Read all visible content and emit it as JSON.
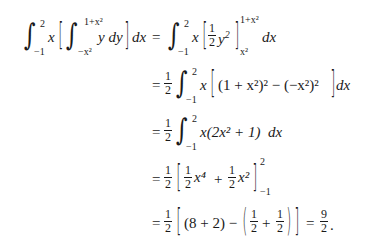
{
  "document": {
    "type": "math-derivation",
    "lines": [
      {
        "lhs": "∫_{-1}^{2} x [ ∫_{-x^2}^{1+x^2} y dy ] dx",
        "rhs": "∫_{-1}^{2} x [ (1/2) y^2 ]_{x^2}^{1+x^2} dx"
      },
      {
        "rhs": "(1/2) ∫_{-1}^{2} x [ (1 + x^2)^2 − (−x^2)^2 ] dx"
      },
      {
        "rhs": "(1/2) ∫_{-1}^{2} x(2x^2 + 1) dx"
      },
      {
        "rhs": "(1/2) [ (1/2) x^4 + (1/2) x^2 ]_{-1}^{2}"
      },
      {
        "rhs": "(1/2) [ (8 + 2) − ( 1/2 + 1/2 ) ] = 9/2."
      }
    ],
    "symbols": {
      "eq": "=",
      "half_num": "1",
      "half_den": "2",
      "nine": "9",
      "lower_limit": "−1",
      "upper_limit": "2",
      "inner_upper": "1+x²",
      "inner_lower": "−x²",
      "eval_lower": "x²",
      "integrand_inner": "y dy",
      "dx": "dx",
      "x": "x",
      "y2": "y",
      "line2_body": "(1 + x²)² − (−x²)²",
      "line3_body": "x(2x² + 1)",
      "x4": "x⁴",
      "plus": "+",
      "x2": "x²",
      "line5_a": "(8 + 2) −",
      "period": "."
    }
  }
}
